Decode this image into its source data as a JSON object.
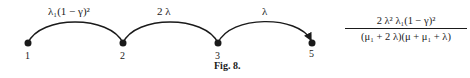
{
  "figure": {
    "caption": "Fig. 8.",
    "nodes": [
      {
        "id": "1",
        "label": "1"
      },
      {
        "id": "2",
        "label": "2"
      },
      {
        "id": "3",
        "label": "3"
      },
      {
        "id": "5",
        "label": "5"
      }
    ],
    "edges": [
      {
        "from": "1",
        "to": "2",
        "label": "λ₁(1 − γ)²"
      },
      {
        "from": "2",
        "to": "3",
        "label": "2 λ"
      },
      {
        "from": "3",
        "to": "5",
        "label": "λ"
      }
    ],
    "result": {
      "numerator": "2 λ² λ₁(1 − γ)²",
      "denominator": "(μ₁ + 2 λ)(μ + μ₁ + λ)"
    },
    "colors": {
      "ink": "#1a1a1a",
      "background": "#ffffff"
    }
  }
}
